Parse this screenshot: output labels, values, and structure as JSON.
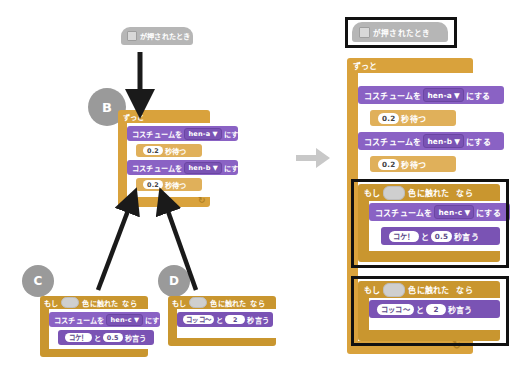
{
  "page": {
    "top_strip_text": "",
    "transition_arrow_icon": "right-arrow-icon"
  },
  "labels": {
    "when_flag_clicked": "が押されたとき",
    "forever": "ずっと",
    "switch_costume_prefix": "コスチュームを",
    "switch_costume_suffix": "にする",
    "wait_suffix": "秒待つ",
    "if_prefix": "もし",
    "touching_color": "色に触れた",
    "if_suffix": "なら",
    "say_joiner": "と",
    "say_suffix": "秒言う",
    "dropdown_caret": "▼",
    "loop_arrow": "↻"
  },
  "values": {
    "costume_a": "hen-a",
    "costume_b": "hen-b",
    "costume_c": "hen-c",
    "wait_time": "0.2",
    "say_koke": "コケ！",
    "say_koke_secs": "0.5",
    "say_kokko": "コッコ〜",
    "say_kokko_secs": "2"
  },
  "badges": {
    "b": "B",
    "c": "C",
    "d": "D"
  },
  "colors": {
    "looks": "#8a62c4",
    "control": "#d9a23c",
    "event": "#b6b6b6",
    "highlight": "#111111",
    "badge": "#9a9a9a",
    "arrow": "#1a1a1a",
    "transition_arrow": "#c8c8c8"
  },
  "left_panel": {
    "hat_block": {
      "icon": "green-flag-icon",
      "label": "が押されたとき"
    },
    "script_b": {
      "header": "ずっと",
      "statements": [
        {
          "type": "switch-costume",
          "prefix": "コスチュームを",
          "value": "hen-a",
          "suffix": "にする"
        },
        {
          "type": "wait",
          "value": "0.2",
          "suffix": "秒待つ"
        },
        {
          "type": "switch-costume",
          "prefix": "コスチュームを",
          "value": "hen-b",
          "suffix": "にする"
        },
        {
          "type": "wait",
          "value": "0.2",
          "suffix": "秒待つ"
        }
      ]
    },
    "script_c": {
      "condition": {
        "prefix": "もし",
        "sensor": "色に触れた",
        "suffix": "なら"
      },
      "statements": [
        {
          "type": "switch-costume",
          "prefix": "コスチュームを",
          "value": "hen-c",
          "suffix": "にする"
        },
        {
          "type": "say-for-secs",
          "message": "コケ！",
          "joiner": "と",
          "secs": "0.5",
          "suffix": "秒言う"
        }
      ]
    },
    "script_d": {
      "condition": {
        "prefix": "もし",
        "sensor": "色に触れた",
        "suffix": "なら"
      },
      "statements": [
        {
          "type": "say-for-secs",
          "message": "コッコ〜",
          "joiner": "と",
          "secs": "2",
          "suffix": "秒言う"
        }
      ]
    }
  },
  "right_panel": {
    "hat_block": {
      "icon": "green-flag-icon",
      "label": "が押されたとき"
    },
    "forever": "ずっと",
    "statements": [
      {
        "type": "switch-costume",
        "prefix": "コスチュームを",
        "value": "hen-a",
        "suffix": "にする"
      },
      {
        "type": "wait",
        "value": "0.2",
        "suffix": "秒待つ"
      },
      {
        "type": "switch-costume",
        "prefix": "コスチュームを",
        "value": "hen-b",
        "suffix": "にする"
      },
      {
        "type": "wait",
        "value": "0.2",
        "suffix": "秒待つ"
      }
    ],
    "if_block_1": {
      "condition": {
        "prefix": "もし",
        "sensor": "色に触れた",
        "suffix": "なら"
      },
      "statements": [
        {
          "type": "switch-costume",
          "prefix": "コスチュームを",
          "value": "hen-c",
          "suffix": "にする"
        },
        {
          "type": "say-for-secs",
          "message": "コケ！",
          "joiner": "と",
          "secs": "0.5",
          "suffix": "秒言う"
        }
      ]
    },
    "if_block_2": {
      "condition": {
        "prefix": "もし",
        "sensor": "色に触れた",
        "suffix": "なら"
      },
      "statements": [
        {
          "type": "say-for-secs",
          "message": "コッコ〜",
          "joiner": "と",
          "secs": "2",
          "suffix": "秒言う"
        }
      ]
    }
  }
}
